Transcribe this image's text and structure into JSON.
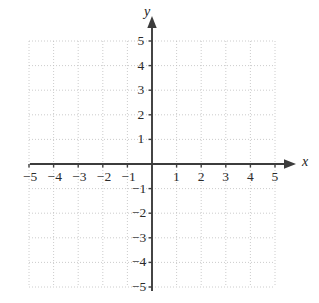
{
  "chart_data": {
    "type": "scatter",
    "title": "",
    "xlabel": "x",
    "ylabel": "y",
    "xlim": [
      -5,
      5
    ],
    "ylim": [
      -5,
      5
    ],
    "grid": true,
    "grid_step": 1,
    "legend": "none",
    "series": [],
    "x_tick_labels": [
      "-5",
      "-4",
      "-3",
      "-2",
      "-1",
      "1",
      "2",
      "3",
      "4",
      "5"
    ],
    "x_tick_values": [
      -5,
      -4,
      -3,
      -2,
      -1,
      1,
      2,
      3,
      4,
      5
    ],
    "y_tick_labels": [
      "5",
      "4",
      "3",
      "2",
      "1",
      "-1",
      "-2",
      "-3",
      "-4",
      "-5"
    ],
    "y_tick_values": [
      5,
      4,
      3,
      2,
      1,
      -1,
      -2,
      -3,
      -4,
      -5
    ],
    "origin_label": "",
    "annotations": [],
    "arrows": [
      "x-positive",
      "y-positive"
    ],
    "colors": {
      "grid": "#bfbfbf",
      "axis": "#404040",
      "text": "#2b2b2b",
      "background": "#ffffff"
    }
  },
  "axis_labels": {
    "x": "x",
    "y": "y"
  },
  "ticks": {
    "x_neg": [
      {
        "label": "-5",
        "value": -5
      },
      {
        "label": "-4",
        "value": -4
      },
      {
        "label": "-3",
        "value": -3
      },
      {
        "label": "-2",
        "value": -2
      },
      {
        "label": "-1",
        "value": -1
      }
    ],
    "x_pos": [
      {
        "label": "1",
        "value": 1
      },
      {
        "label": "2",
        "value": 2
      },
      {
        "label": "3",
        "value": 3
      },
      {
        "label": "4",
        "value": 4
      },
      {
        "label": "5",
        "value": 5
      }
    ],
    "y_pos": [
      {
        "label": "5",
        "value": 5
      },
      {
        "label": "4",
        "value": 4
      },
      {
        "label": "3",
        "value": 3
      },
      {
        "label": "2",
        "value": 2
      },
      {
        "label": "1",
        "value": 1
      }
    ],
    "y_neg": [
      {
        "label": "-1",
        "value": -1
      },
      {
        "label": "-2",
        "value": -2
      },
      {
        "label": "-3",
        "value": -3
      },
      {
        "label": "-4",
        "value": -4
      },
      {
        "label": "-5",
        "value": -5
      }
    ]
  }
}
